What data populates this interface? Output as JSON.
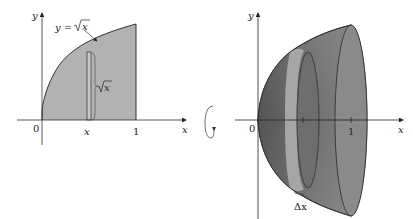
{
  "left_figure": {
    "y_axis_label": "y",
    "x_axis_label": "x",
    "origin_label": "0",
    "x_tick_one_label": "1",
    "strip_x_label": "x",
    "curve_label_prefix": "y = ",
    "curve_label_radicand": "x",
    "strip_height_label_radicand": "x",
    "region_fill": "#b4b4b4",
    "strip_fill": "#c4c4c4"
  },
  "right_figure": {
    "y_axis_label": "y",
    "x_axis_label": "x",
    "origin_label": "0",
    "x_tick_one_label": "1",
    "delta_label": "Δx",
    "solid_fill": "#7d7d7d",
    "shell_fill": "#a8a8a8"
  },
  "rotation_indicator": {
    "icon": "rotation-arrow-icon",
    "description": "rotation about x-axis"
  }
}
